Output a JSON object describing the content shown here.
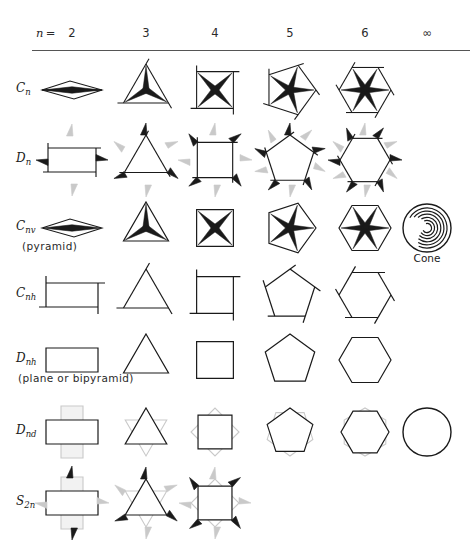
{
  "figure": {
    "width": 474,
    "height": 555,
    "background": "#ffffff",
    "stroke_dark": "#1a1a1a",
    "stroke_gray": "#c9c9c9",
    "rule_color": "#555555"
  },
  "header": {
    "n_equals": "n =",
    "columns": [
      {
        "label": "2",
        "x": 72,
        "n": 2
      },
      {
        "label": "3",
        "x": 146,
        "n": 3
      },
      {
        "label": "4",
        "x": 215,
        "n": 4
      },
      {
        "label": "5",
        "x": 290,
        "n": 5
      },
      {
        "label": "6",
        "x": 365,
        "n": 6
      },
      {
        "label": "∞",
        "x": 427,
        "n": 0
      }
    ],
    "y": 34,
    "rule_y": 50
  },
  "rows": [
    {
      "key": "Cn",
      "label_main": "C",
      "label_sub": "n",
      "sub_caption": "",
      "y": 90,
      "kind": "rotor",
      "cells": [
        {
          "col": 0,
          "n": 2,
          "show": true
        },
        {
          "col": 1,
          "n": 3,
          "show": true
        },
        {
          "col": 2,
          "n": 4,
          "show": true
        },
        {
          "col": 3,
          "n": 5,
          "show": true
        },
        {
          "col": 4,
          "n": 6,
          "show": true
        },
        {
          "col": 5,
          "n": 0,
          "show": false
        }
      ]
    },
    {
      "key": "Dn",
      "label_main": "D",
      "label_sub": "n",
      "sub_caption": "",
      "y": 160,
      "kind": "poly_with_c2",
      "cells": [
        {
          "col": 0,
          "n": 2,
          "show": true
        },
        {
          "col": 1,
          "n": 3,
          "show": true
        },
        {
          "col": 2,
          "n": 4,
          "show": true
        },
        {
          "col": 3,
          "n": 5,
          "show": true
        },
        {
          "col": 4,
          "n": 6,
          "show": true
        },
        {
          "col": 5,
          "n": 0,
          "show": false
        }
      ]
    },
    {
      "key": "Cnv",
      "label_main": "C",
      "label_sub": "nv",
      "sub_caption": "(pyramid)",
      "y": 228,
      "kind": "rotor_filled",
      "cells": [
        {
          "col": 0,
          "n": 2,
          "show": true
        },
        {
          "col": 1,
          "n": 3,
          "show": true
        },
        {
          "col": 2,
          "n": 4,
          "show": true
        },
        {
          "col": 3,
          "n": 5,
          "show": true
        },
        {
          "col": 4,
          "n": 6,
          "show": true
        },
        {
          "col": 5,
          "n": 0,
          "show": true,
          "special": "cone",
          "caption": "Cone"
        }
      ]
    },
    {
      "key": "Cnh",
      "label_main": "C",
      "label_sub": "nh",
      "sub_caption": "",
      "y": 295,
      "kind": "poly_open",
      "cells": [
        {
          "col": 0,
          "n": 2,
          "show": true
        },
        {
          "col": 1,
          "n": 3,
          "show": true
        },
        {
          "col": 2,
          "n": 4,
          "show": true
        },
        {
          "col": 3,
          "n": 5,
          "show": true
        },
        {
          "col": 4,
          "n": 6,
          "show": true
        },
        {
          "col": 5,
          "n": 0,
          "show": false
        }
      ]
    },
    {
      "key": "Dnh",
      "label_main": "D",
      "label_sub": "nh",
      "sub_caption": "(plane  or  bipyramid)",
      "y": 360,
      "kind": "poly_plain",
      "cells": [
        {
          "col": 0,
          "n": 2,
          "show": true
        },
        {
          "col": 1,
          "n": 3,
          "show": true
        },
        {
          "col": 2,
          "n": 4,
          "show": true
        },
        {
          "col": 3,
          "n": 5,
          "show": true
        },
        {
          "col": 4,
          "n": 6,
          "show": true
        },
        {
          "col": 5,
          "n": 0,
          "show": false
        }
      ]
    },
    {
      "key": "Dnd",
      "label_main": "D",
      "label_sub": "nd",
      "sub_caption": "",
      "y": 432,
      "kind": "double_poly",
      "cells": [
        {
          "col": 0,
          "n": 2,
          "show": true
        },
        {
          "col": 1,
          "n": 3,
          "show": true
        },
        {
          "col": 2,
          "n": 4,
          "show": true
        },
        {
          "col": 3,
          "n": 5,
          "show": true
        },
        {
          "col": 4,
          "n": 6,
          "show": true
        },
        {
          "col": 5,
          "n": 0,
          "show": true,
          "special": "circle"
        }
      ]
    },
    {
      "key": "S2n",
      "label_main": "S",
      "label_sub": "2n",
      "sub_caption": "",
      "y": 503,
      "kind": "double_poly_c2",
      "cells": [
        {
          "col": 0,
          "n": 2,
          "show": true
        },
        {
          "col": 1,
          "n": 3,
          "show": true
        },
        {
          "col": 2,
          "n": 4,
          "show": true
        },
        {
          "col": 3,
          "n": 5,
          "show": false
        },
        {
          "col": 4,
          "n": 6,
          "show": false
        },
        {
          "col": 5,
          "n": 0,
          "show": false
        }
      ]
    }
  ],
  "labels": {
    "cone": "Cone",
    "pyramid": "(pyramid)",
    "plane_or_bipyramid": "(plane  or  bipyramid)"
  },
  "row_label_x": 16,
  "geometry": {
    "cell_radius": 30,
    "rotor_hub": 3.5
  }
}
